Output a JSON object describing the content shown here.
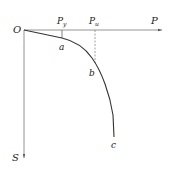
{
  "diagram": {
    "type": "load-settlement curve",
    "axes": {
      "origin_label": "O",
      "x_label": "P",
      "y_label": "S"
    },
    "markers": [
      {
        "label_main": "P",
        "label_sub": "y",
        "style": "solid-tick"
      },
      {
        "label_main": "P",
        "label_sub": "u",
        "style": "dashed"
      }
    ],
    "points": [
      {
        "label": "a"
      },
      {
        "label": "b"
      },
      {
        "label": "c"
      }
    ],
    "colors": {
      "axis": "#777777",
      "curve": "#333333",
      "text": "#222222"
    }
  }
}
